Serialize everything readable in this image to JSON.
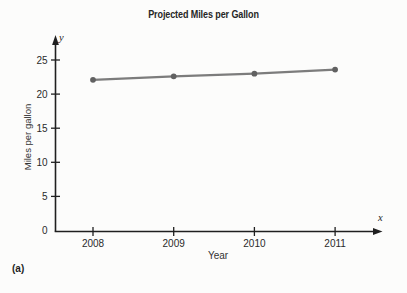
{
  "figure_label": "(a)",
  "chart_data": {
    "type": "line",
    "title": "Projected Miles per Gallon",
    "xlabel": "Year",
    "ylabel": "Miles per gallon",
    "x_axis_symbol": "x",
    "y_axis_symbol": "y",
    "categories": [
      "2008",
      "2009",
      "2010",
      "2011"
    ],
    "values": [
      22.1,
      22.6,
      23.0,
      23.6
    ],
    "y_ticks": [
      0,
      5,
      10,
      15,
      20,
      25
    ],
    "ylim": [
      0,
      27.5
    ],
    "grid": false,
    "legend": "none",
    "colors": {
      "line": "#7c7c7c",
      "marker": "#616161",
      "axis": "#1f1f1f",
      "text": "#2a2a2a",
      "background": "#fcfcfb"
    }
  }
}
